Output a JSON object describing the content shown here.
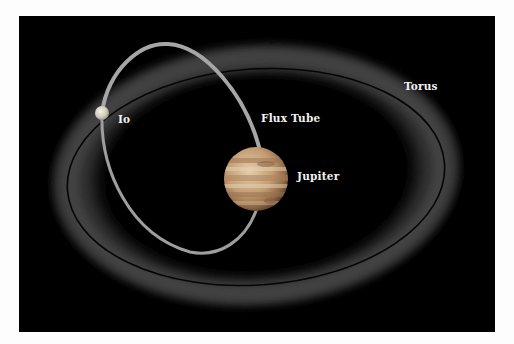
{
  "diagram": {
    "labels": {
      "io": "Io",
      "flux_tube": "Flux Tube",
      "jupiter": "Jupiter",
      "torus": "Torus"
    },
    "colors": {
      "background": "#000000",
      "frame": "#fdfdfd",
      "torus_glow": "#5a5a5a",
      "flux_tube": "#a8a8a8",
      "io": "#d8d8d0",
      "orbit_line": "#050505",
      "jupiter_base": "#c9a57e",
      "jupiter_band_dark": "#9b7553",
      "jupiter_band_light": "#e6d3b6",
      "label_text": "#f2f2f2"
    }
  }
}
